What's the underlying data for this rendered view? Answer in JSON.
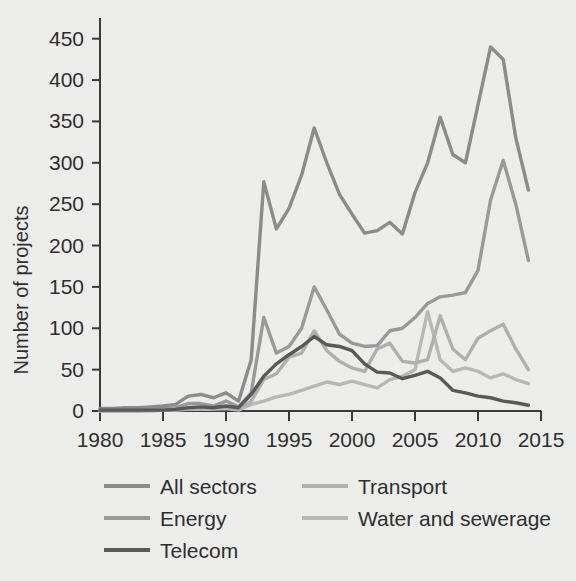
{
  "chart_data": {
    "type": "line",
    "title": "",
    "xlabel": "",
    "ylabel": "Number of projects",
    "xlim": [
      1980,
      2015
    ],
    "ylim": [
      0,
      475
    ],
    "grid": false,
    "legend_position": "bottom",
    "xticks": [
      "1980",
      "1985",
      "1990",
      "1995",
      "2000",
      "2005",
      "2010",
      "2015"
    ],
    "yticks": [
      "0",
      "50",
      "100",
      "150",
      "200",
      "250",
      "300",
      "350",
      "400",
      "450"
    ],
    "x": [
      1980,
      1981,
      1982,
      1983,
      1984,
      1985,
      1986,
      1987,
      1988,
      1989,
      1990,
      1991,
      1992,
      1993,
      1994,
      1995,
      1996,
      1997,
      1998,
      1999,
      2000,
      2001,
      2002,
      2003,
      2004,
      2005,
      2006,
      2007,
      2008,
      2009,
      2010,
      2011,
      2012,
      2013,
      2014
    ],
    "series": [
      {
        "name": "All sectors",
        "color": "#8c8c8c",
        "values": [
          3,
          3,
          4,
          4,
          5,
          6,
          8,
          18,
          20,
          16,
          22,
          12,
          62,
          277,
          220,
          245,
          285,
          342,
          300,
          262,
          238,
          215,
          218,
          228,
          214,
          264,
          300,
          355,
          310,
          300,
          370,
          440,
          425,
          330,
          267
        ]
      },
      {
        "name": "Energy",
        "color": "#9a9a9a",
        "values": [
          1,
          1,
          2,
          2,
          2,
          3,
          4,
          9,
          9,
          6,
          12,
          5,
          22,
          113,
          70,
          78,
          100,
          150,
          122,
          93,
          82,
          78,
          79,
          97,
          100,
          113,
          130,
          138,
          140,
          143,
          170,
          255,
          303,
          250,
          182
        ]
      },
      {
        "name": "Telecom",
        "color": "#595959",
        "values": [
          1,
          1,
          1,
          1,
          1,
          1,
          2,
          4,
          5,
          4,
          6,
          4,
          20,
          42,
          57,
          68,
          78,
          90,
          80,
          78,
          73,
          57,
          47,
          46,
          39,
          43,
          48,
          40,
          25,
          22,
          18,
          16,
          12,
          10,
          7
        ]
      },
      {
        "name": "Transport",
        "color": "#b0b0b0",
        "values": [
          0,
          0,
          0,
          0,
          1,
          1,
          1,
          3,
          4,
          3,
          5,
          2,
          12,
          38,
          45,
          65,
          70,
          97,
          73,
          60,
          52,
          48,
          75,
          82,
          60,
          58,
          62,
          115,
          75,
          62,
          88,
          97,
          105,
          75,
          50
        ]
      },
      {
        "name": "Water and sewerage",
        "color": "#b8b8b8",
        "values": [
          0,
          0,
          0,
          0,
          0,
          1,
          1,
          2,
          2,
          2,
          3,
          1,
          8,
          12,
          17,
          20,
          25,
          30,
          35,
          32,
          36,
          32,
          28,
          38,
          42,
          50,
          120,
          62,
          48,
          52,
          48,
          40,
          45,
          38,
          33
        ]
      }
    ],
    "legend": [
      {
        "label": "All sectors",
        "color": "#8c8c8c"
      },
      {
        "label": "Energy",
        "color": "#9a9a9a"
      },
      {
        "label": "Telecom",
        "color": "#595959"
      },
      {
        "label": "Transport",
        "color": "#b0b0b0"
      },
      {
        "label": "Water and sewerage",
        "color": "#b8b8b8"
      }
    ]
  }
}
